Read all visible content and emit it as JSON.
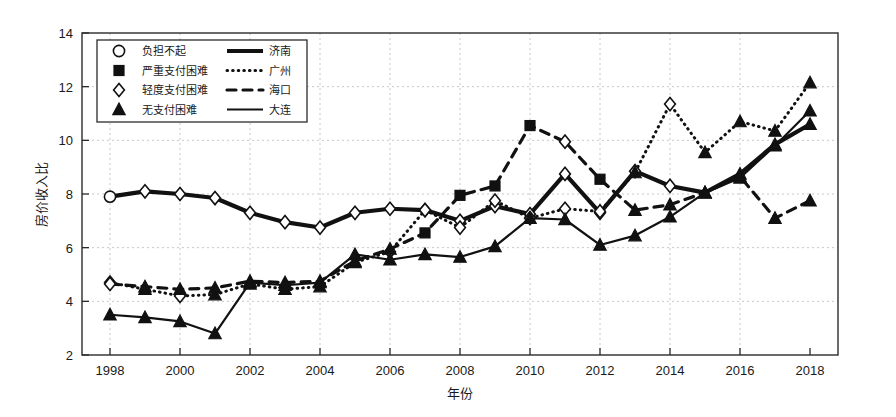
{
  "chart_data": {
    "type": "line",
    "title": "",
    "xlabel": "年份",
    "ylabel": "房价收入比",
    "xlim": [
      1997.2,
      2018.8
    ],
    "ylim": [
      2,
      14
    ],
    "xticks": [
      1998,
      2000,
      2002,
      2004,
      2006,
      2008,
      2010,
      2012,
      2014,
      2016,
      2018
    ],
    "yticks": [
      2,
      4,
      6,
      8,
      10,
      12,
      14
    ],
    "grid": true,
    "legend_position": "top-left",
    "x": [
      1998,
      1999,
      2000,
      2001,
      2002,
      2003,
      2004,
      2005,
      2006,
      2007,
      2008,
      2009,
      2010,
      2011,
      2012,
      2013,
      2014,
      2015,
      2016,
      2017,
      2018
    ],
    "series": [
      {
        "name": "济南",
        "line_style": "thick-solid",
        "values": [
          7.9,
          8.1,
          8.0,
          7.85,
          7.3,
          6.95,
          6.75,
          7.3,
          7.45,
          7.4,
          7.0,
          7.55,
          7.25,
          8.75,
          7.3,
          8.85,
          8.3,
          8.05,
          8.75,
          9.85,
          10.6
        ],
        "markers": [
          "负担不起",
          "轻度支付困难",
          "轻度支付困难",
          "轻度支付困难",
          "轻度支付困难",
          "轻度支付困难",
          "轻度支付困难",
          "轻度支付困难",
          "轻度支付困难",
          "轻度支付困难",
          "轻度支付困难",
          "轻度支付困难",
          "轻度支付困难",
          "轻度支付困难",
          "轻度支付困难",
          "轻度支付困难",
          "轻度支付困难",
          "无支付困难",
          "无支付困难",
          "无支付困难",
          "无支付困难"
        ]
      },
      {
        "name": "广州",
        "line_style": "dotted",
        "values": [
          4.7,
          4.45,
          4.2,
          4.25,
          4.65,
          4.45,
          4.55,
          5.45,
          5.85,
          7.4,
          6.75,
          7.75,
          7.1,
          7.45,
          7.35,
          8.8,
          11.35,
          9.55,
          10.7,
          10.35,
          12.15
        ],
        "markers": [
          "轻度支付困难",
          "无支付困难",
          "轻度支付困难",
          "无支付困难",
          "无支付困难",
          "无支付困难",
          "无支付困难",
          "无支付困难",
          "轻度支付困难",
          "轻度支付困难",
          "轻度支付困难",
          "轻度支付困难",
          "轻度支付困难",
          "轻度支付困难",
          "轻度支付困难",
          "无支付困难",
          "轻度支付困难",
          "无支付困难",
          "无支付困难",
          "无支付困难",
          "无支付困难"
        ]
      },
      {
        "name": "海口",
        "line_style": "dashed",
        "values": [
          4.65,
          4.55,
          4.45,
          4.5,
          4.75,
          4.7,
          4.75,
          5.5,
          5.95,
          6.55,
          7.95,
          8.3,
          10.55,
          9.95,
          8.55,
          7.4,
          7.6,
          8.05,
          8.65,
          7.1,
          7.75
        ],
        "markers": [
          "轻度支付困难",
          "无支付困难",
          "无支付困难",
          "无支付困难",
          "无支付困难",
          "无支付困难",
          "无支付困难",
          "无支付困难",
          "无支付困难",
          "严重支付困难",
          "严重支付困难",
          "严重支付困难",
          "严重支付困难",
          "轻度支付困难",
          "严重支付困难",
          "无支付困难",
          "无支付困难",
          "无支付困难",
          "无支付困难",
          "无支付困难",
          "无支付困难"
        ]
      },
      {
        "name": "大连",
        "line_style": "solid",
        "values": [
          3.5,
          3.4,
          3.25,
          2.8,
          4.7,
          4.6,
          4.7,
          5.75,
          5.55,
          5.75,
          5.65,
          6.05,
          7.1,
          7.05,
          6.1,
          6.45,
          7.15,
          8.05,
          8.6,
          9.8,
          11.1
        ],
        "markers": [
          "无支付困难",
          "无支付困难",
          "无支付困难",
          "无支付困难",
          "无支付困难",
          "无支付困难",
          "无支付困难",
          "无支付困难",
          "无支付困难",
          "无支付困难",
          "无支付困难",
          "无支付困难",
          "无支付困难",
          "无支付困难",
          "无支付困难",
          "无支付困难",
          "无支付困难",
          "无支付困难",
          "无支付困难",
          "无支付困难",
          "无支付困难"
        ]
      }
    ],
    "marker_legend": [
      {
        "symbol": "circle",
        "label": "负担不起"
      },
      {
        "symbol": "square-filled",
        "label": "严重支付困难"
      },
      {
        "symbol": "diamond",
        "label": "轻度支付困难"
      },
      {
        "symbol": "triangle-filled",
        "label": "无支付困难"
      }
    ],
    "line_legend": [
      {
        "style": "thick-solid",
        "label": "济南"
      },
      {
        "style": "dotted",
        "label": "广州"
      },
      {
        "style": "dashed",
        "label": "海口"
      },
      {
        "style": "solid",
        "label": "大连"
      }
    ]
  }
}
